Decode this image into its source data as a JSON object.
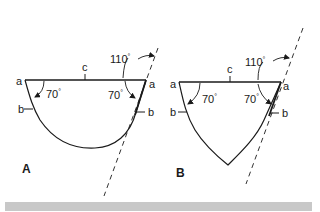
{
  "figure": {
    "panels": [
      {
        "id": "A",
        "panel_label": "A",
        "shape": "semicircular-curved profile",
        "labels": {
          "top_left_point": "a",
          "top_right_point": "a",
          "side_left": "b",
          "side_right": "b",
          "top_edge": "c",
          "angle_left": "70",
          "angle_right": "70",
          "angle_exterior": "110"
        }
      },
      {
        "id": "B",
        "panel_label": "B",
        "shape": "pointed (gothic) curved profile",
        "labels": {
          "top_left_point": "a",
          "top_right_point": "a",
          "side_left": "b",
          "side_right": "b",
          "top_edge": "c",
          "angle_left": "70",
          "angle_right": "70",
          "angle_exterior": "110"
        }
      }
    ],
    "degree_symbol": "°",
    "colors": {
      "line": "#1a1a1a",
      "background": "#ffffff",
      "footer_bar": "#c8c8c8"
    }
  }
}
